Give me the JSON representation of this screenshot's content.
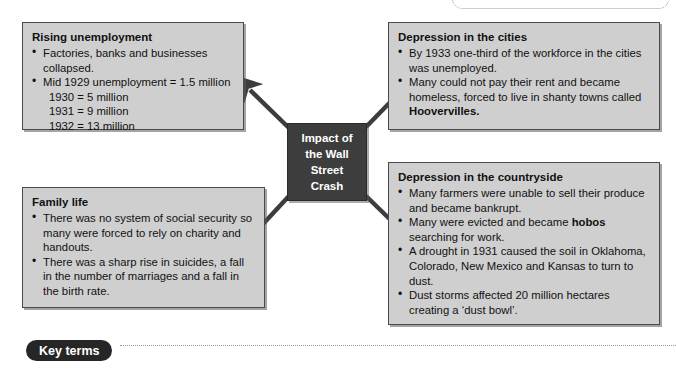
{
  "page": {
    "type": "concept-map",
    "background": "#ffffff",
    "box_fill": "#cfcfcf",
    "box_border": "#4a4a4a",
    "center_fill": "#3d3d3d",
    "center_text_color": "#ffffff",
    "arrow_color": "#3d3d3d",
    "dotted_rule_color": "#9a9aa5"
  },
  "center": {
    "lines": [
      "Impact of",
      "the Wall",
      "Street",
      "Crash"
    ]
  },
  "boxes": {
    "rising_unemployment": {
      "title": "Rising unemployment",
      "items": [
        {
          "bullet": true,
          "text": "Factories, banks and businesses collapsed."
        },
        {
          "bullet": true,
          "text": "Mid 1929 unemployment = 1.5 million"
        },
        {
          "bullet": false,
          "text": "1930 = 5 million"
        },
        {
          "bullet": false,
          "text": "1931 = 9 million"
        },
        {
          "bullet": false,
          "text": "1932 = 13 million"
        }
      ]
    },
    "depression_cities": {
      "title": "Depression in the cities",
      "items": [
        {
          "bullet": true,
          "html": "By 1933 one-third of the workforce in the cities was unemployed."
        },
        {
          "bullet": true,
          "html": "Many could not pay their rent and became homeless, forced to live in shanty towns called <b>Hoovervilles.</b>"
        }
      ]
    },
    "depression_countryside": {
      "title": "Depression in the countryside",
      "items": [
        {
          "bullet": true,
          "html": "Many farmers were unable to sell their produce and became bankrupt."
        },
        {
          "bullet": true,
          "html": "Many were evicted and became <b>hobos</b> searching for work."
        },
        {
          "bullet": true,
          "html": "A drought in 1931 caused the soil in Oklahoma, Colorado, New Mexico and Kansas to turn to dust."
        },
        {
          "bullet": true,
          "html": "Dust storms affected 20 million hectares creating a &lsquo;dust bowl&rsquo;."
        }
      ]
    },
    "family_life": {
      "title": "Family life",
      "items": [
        {
          "bullet": true,
          "html": "There was no system of social security so many were forced to rely on charity and handouts."
        },
        {
          "bullet": true,
          "html": "There was a sharp rise in suicides, a fall in the number of marriages and a fall in the birth rate."
        }
      ]
    }
  },
  "footer": {
    "key_terms_label": "Key terms"
  }
}
